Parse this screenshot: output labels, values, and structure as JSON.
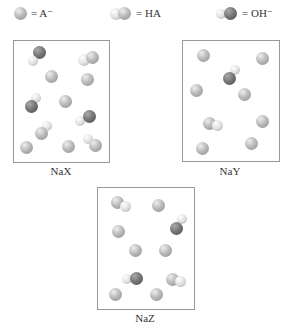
{
  "legend": [
    {
      "symbol": "a-minus-sphere",
      "text": "= A⁻"
    },
    {
      "symbol": "ha-molecule",
      "text": "= HA"
    },
    {
      "symbol": "oh-minus-molecule",
      "text": "= OH⁻"
    }
  ],
  "panels": [
    {
      "label": "NaX",
      "counts": {
        "A-": 5,
        "HA": 4,
        "OH-": 3
      }
    },
    {
      "label": "NaY",
      "counts": {
        "A-": 8,
        "HA": 1,
        "OH-": 1
      }
    },
    {
      "label": "NaZ",
      "counts": {
        "A-": 6,
        "HA": 3,
        "OH-": 2
      }
    }
  ]
}
